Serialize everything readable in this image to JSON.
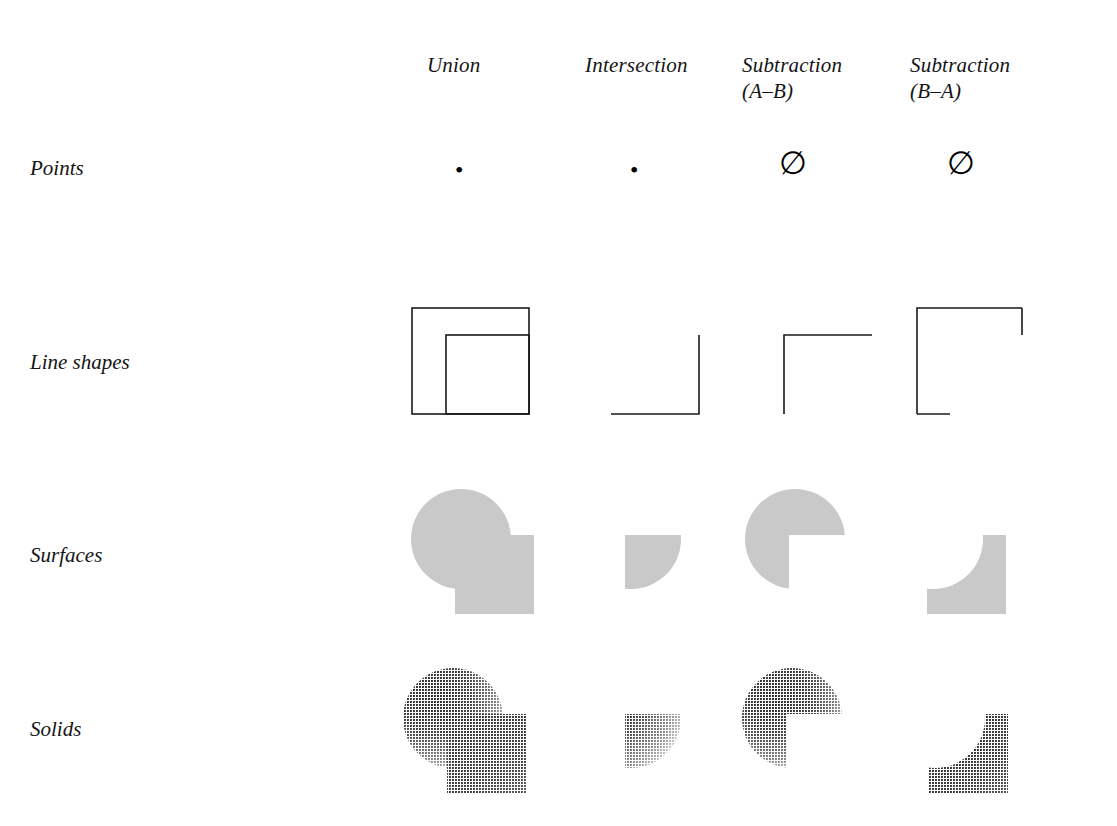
{
  "figure": {
    "kind": "boolean-operation-matrix",
    "background_color": "#ffffff",
    "line_color": "#1a1a1a",
    "surface_fill_color": "#c9c9c9",
    "solid_light_color": "#d0d0d0",
    "solid_dark_color": "#2b2b2b"
  },
  "columns": [
    {
      "id": "union",
      "label": "Union"
    },
    {
      "id": "intersection",
      "label": "Intersection"
    },
    {
      "id": "subtract_ab",
      "label": "Subtraction\n(A–B)"
    },
    {
      "id": "subtract_ba",
      "label": "Subtraction\n(B–A)"
    }
  ],
  "rows": [
    {
      "id": "points",
      "label": "Points"
    },
    {
      "id": "line_shapes",
      "label": "Line shapes"
    },
    {
      "id": "surfaces",
      "label": "Surfaces"
    },
    {
      "id": "solids",
      "label": "Solids"
    }
  ],
  "cells": {
    "points": {
      "union": {
        "symbol": "•",
        "meaning": "single point"
      },
      "intersection": {
        "symbol": "•",
        "meaning": "single point"
      },
      "subtract_ab": {
        "symbol": "∅",
        "meaning": "empty set"
      },
      "subtract_ba": {
        "symbol": "∅",
        "meaning": "empty set"
      }
    },
    "line_shapes": {
      "union": {
        "meaning": "two overlapping open square outlines"
      },
      "intersection": {
        "meaning": "L-shaped corner, left and bottom edges"
      },
      "subtract_ab": {
        "meaning": "gamma-shaped corner, top and left edges"
      },
      "subtract_ba": {
        "meaning": "square outline with gaps on right and bottom edges"
      }
    },
    "surfaces": {
      "union": {
        "meaning": "filled circle merged with filled square"
      },
      "intersection": {
        "meaning": "filled lens region where circle meets square"
      },
      "subtract_ab": {
        "meaning": "filled circle with square-shaped notch removed"
      },
      "subtract_ba": {
        "meaning": "filled square with concave circular bite removed"
      }
    },
    "solids": {
      "union": {
        "meaning": "shaded sphere merged with shaded cube"
      },
      "intersection": {
        "meaning": "shaded lens solid"
      },
      "subtract_ab": {
        "meaning": "shaded sphere with cube subtracted"
      },
      "subtract_ba": {
        "meaning": "shaded cube with sphere subtracted"
      }
    }
  }
}
